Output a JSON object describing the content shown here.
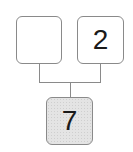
{
  "number_bond": {
    "part_left": {
      "value": ""
    },
    "part_right": {
      "value": "2"
    },
    "whole": {
      "value": "7"
    }
  },
  "colors": {
    "border": "#8a8a8a",
    "whole_fill": "#e4e4e4",
    "part_fill": "#ffffff"
  }
}
